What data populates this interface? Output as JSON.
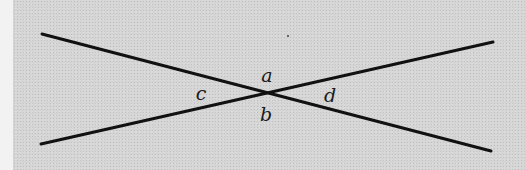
{
  "diagram": {
    "type": "intersecting-lines",
    "background_color": "#d5d5d5",
    "line_color": "#111111",
    "lines": [
      {
        "name": "line-descending",
        "x1": 42,
        "y1": 34,
        "x2": 491,
        "y2": 151
      },
      {
        "name": "line-ascending",
        "x1": 41,
        "y1": 144,
        "x2": 493,
        "y2": 42
      }
    ],
    "intersection": {
      "x": 268,
      "y": 94
    },
    "angle_labels": [
      {
        "id": "a",
        "text": "a",
        "x": 267,
        "y": 75
      },
      {
        "id": "b",
        "text": "b",
        "x": 266,
        "y": 114
      },
      {
        "id": "c",
        "text": "c",
        "x": 201,
        "y": 93
      },
      {
        "id": "d",
        "text": "d",
        "x": 330,
        "y": 95
      }
    ]
  }
}
